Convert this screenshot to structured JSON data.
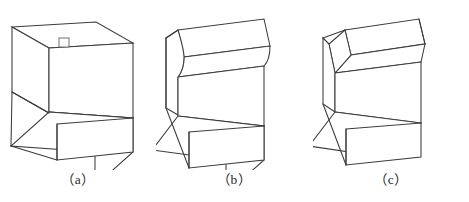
{
  "sheet": {
    "background_color": "#ffffff",
    "line_color": "#3b3b3b",
    "detail_line_color": "#6b6b6b",
    "width": 469,
    "height": 202,
    "description": "Three isometric pictorial views of a stepped block showing different top-edge treatments"
  },
  "figures": [
    {
      "id": "a",
      "caption": "（a）",
      "edge_treatment": "sharp-square-edge",
      "detail_marker": "small-square",
      "detail_marker_label": "square-detail-marker"
    },
    {
      "id": "b",
      "caption": "（b）",
      "edge_treatment": "filleted-rounded-edge",
      "detail_marker": "none",
      "detail_marker_label": ""
    },
    {
      "id": "c",
      "caption": "（c）",
      "edge_treatment": "chamfered-bevel-edge",
      "detail_marker": "none",
      "detail_marker_label": ""
    }
  ]
}
